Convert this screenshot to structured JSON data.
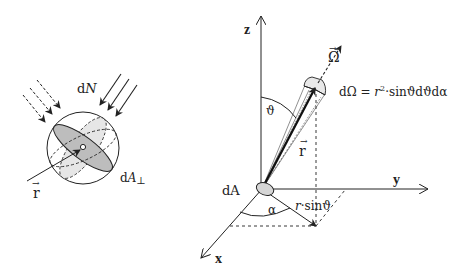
{
  "left_diagram": {
    "flux_label_d": "d",
    "flux_label_N": "N",
    "area_label_d": "d",
    "area_label_A": "A",
    "area_label_perp": "⊥",
    "position_vector_label": "r",
    "vector_arrow": "→"
  },
  "right_diagram": {
    "axis_z": "z",
    "axis_y": "y",
    "axis_x": "x",
    "direction_label": "Ω",
    "direction_arrow": "→",
    "solid_angle_formula_lhs": "dΩ = ",
    "solid_angle_formula_r": "r",
    "solid_angle_formula_exp": "2",
    "solid_angle_formula_rhs": "·sinϑdϑdα",
    "polar_angle": "ϑ",
    "azimuth_angle": "α",
    "radius_label": "r",
    "radius_arrow": "→",
    "area_element": "dA",
    "projection_label_r": "r",
    "projection_label_rest": "·sinϑ"
  },
  "colors": {
    "line": "#222222",
    "shade_dark": "#b8b8b8",
    "shade_light": "#e2e2e2"
  }
}
